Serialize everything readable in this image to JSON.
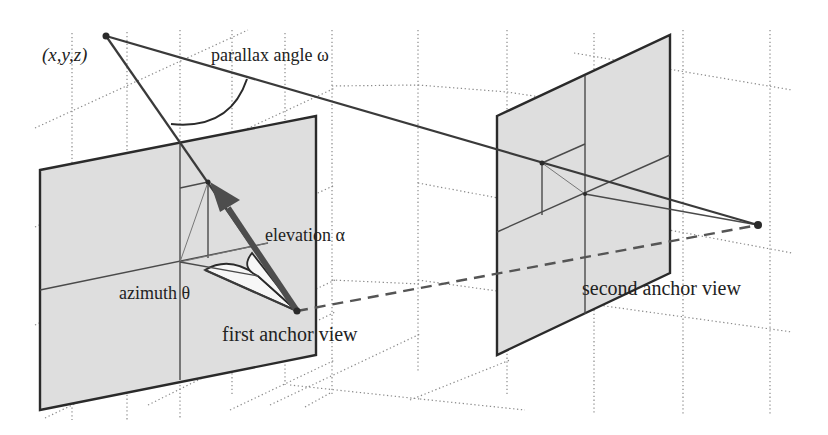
{
  "figure": {
    "type": "3d-geometry-diagram",
    "labels": {
      "point": "(x,y,z)",
      "parallax": "parallax angle ω",
      "elevation": "elevation α",
      "azimuth": "azimuth θ",
      "first_view": "first anchor view",
      "second_view": "second anchor view"
    },
    "colors": {
      "panel_fill": "#dedede",
      "line": "#2a2a2a",
      "arrow": "#4d4d4d",
      "wedge_fill": "#f7f7f7",
      "grid": "#8a8a8a"
    },
    "points": {
      "world_point": [
        106,
        36
      ],
      "first_anchor": [
        297,
        311
      ],
      "second_anchor": [
        758,
        225
      ],
      "projection_on_first_plane": [
        208,
        182
      ],
      "projection_on_second_plane": [
        542,
        163
      ]
    }
  }
}
